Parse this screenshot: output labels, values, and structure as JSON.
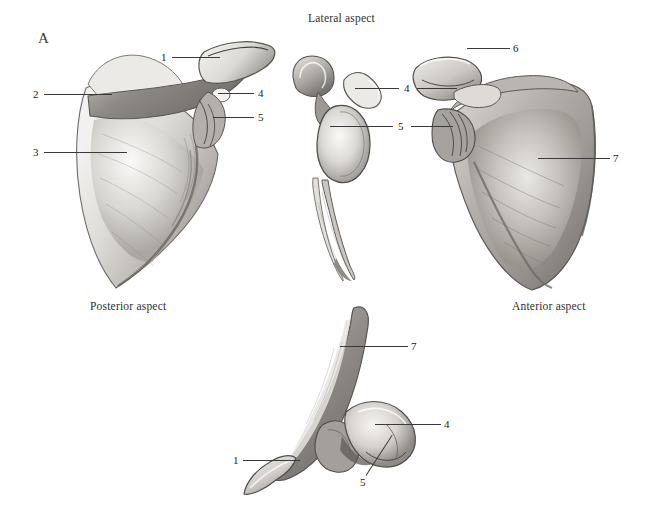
{
  "plate": {
    "panel_letter": "A",
    "background_color": "#ffffff",
    "ink_color": "#3a3a3a",
    "subject": "scapula"
  },
  "captions": [
    {
      "id": "lateral",
      "text": "Lateral aspect",
      "x": 308,
      "y": 12
    },
    {
      "id": "posterior",
      "text": "Posterior aspect",
      "x": 90,
      "y": 300
    },
    {
      "id": "anterior",
      "text": "Anterior aspect",
      "x": 512,
      "y": 300
    }
  ],
  "figures": [
    {
      "id": "posterior-scapula",
      "name": "posterior aspect scapula"
    },
    {
      "id": "lateral-scapula",
      "name": "lateral aspect scapula"
    },
    {
      "id": "anterior-scapula",
      "name": "anterior aspect scapula"
    },
    {
      "id": "superior-scapula",
      "name": "superior aspect scapula"
    }
  ],
  "labels": [
    {
      "id": "p1",
      "figure": "posterior-scapula",
      "text": "1",
      "x": 161,
      "y": 52,
      "line": {
        "x": 172,
        "y": 57,
        "len": 48,
        "angle": 0
      }
    },
    {
      "id": "p2",
      "figure": "posterior-scapula",
      "text": "2",
      "x": 33,
      "y": 89,
      "line": {
        "x": 44,
        "y": 94,
        "len": 68,
        "angle": 0
      }
    },
    {
      "id": "p3",
      "figure": "posterior-scapula",
      "text": "3",
      "x": 33,
      "y": 147,
      "line": {
        "x": 44,
        "y": 152,
        "len": 83,
        "angle": 0
      }
    },
    {
      "id": "p4",
      "figure": "posterior-scapula",
      "text": "4",
      "x": 258,
      "y": 88,
      "line": {
        "x": 218,
        "y": 93,
        "len": 36,
        "angle": 0
      }
    },
    {
      "id": "p5",
      "figure": "posterior-scapula",
      "text": "5",
      "x": 258,
      "y": 112,
      "line": {
        "x": 213,
        "y": 117,
        "len": 41,
        "angle": 0
      }
    },
    {
      "id": "l4",
      "figure": "lateral-scapula",
      "text": "4",
      "x": 404,
      "y": 83,
      "line": {
        "x": 355,
        "y": 88,
        "len": 44,
        "angle": 0
      }
    },
    {
      "id": "l5",
      "figure": "lateral-scapula",
      "text": "5",
      "x": 398,
      "y": 121,
      "line": {
        "x": 330,
        "y": 126,
        "len": 63,
        "angle": 0
      }
    },
    {
      "id": "a4",
      "figure": "anterior-scapula",
      "text": "4",
      "x": 404,
      "y": 83,
      "line": {
        "x": 417,
        "y": 88,
        "len": 40,
        "angle": 0
      }
    },
    {
      "id": "a5",
      "figure": "anterior-scapula",
      "text": "5",
      "x": 398,
      "y": 121,
      "line": {
        "x": 411,
        "y": 126,
        "len": 42,
        "angle": 0
      }
    },
    {
      "id": "a6",
      "figure": "anterior-scapula",
      "text": "6",
      "x": 513,
      "y": 43,
      "line": {
        "x": 467,
        "y": 48,
        "len": 43,
        "angle": 0
      }
    },
    {
      "id": "a7",
      "figure": "anterior-scapula",
      "text": "7",
      "x": 613,
      "y": 153,
      "line": {
        "x": 538,
        "y": 158,
        "len": 72,
        "angle": 0
      }
    },
    {
      "id": "s7",
      "figure": "superior-scapula",
      "text": "7",
      "x": 411,
      "y": 341,
      "line": {
        "x": 340,
        "y": 346,
        "len": 68,
        "angle": 0
      }
    },
    {
      "id": "s4",
      "figure": "superior-scapula",
      "text": "4",
      "x": 444,
      "y": 419,
      "line": {
        "x": 375,
        "y": 424,
        "len": 66,
        "angle": 0
      }
    },
    {
      "id": "s1",
      "figure": "superior-scapula",
      "text": "1",
      "x": 233,
      "y": 455,
      "line": {
        "x": 243,
        "y": 460,
        "len": 57,
        "angle": 0
      }
    },
    {
      "id": "s5",
      "figure": "superior-scapula",
      "text": "5",
      "x": 360,
      "y": 477,
      "line": {
        "x": 366,
        "y": 475,
        "len": 48,
        "angle": -57
      }
    }
  ]
}
